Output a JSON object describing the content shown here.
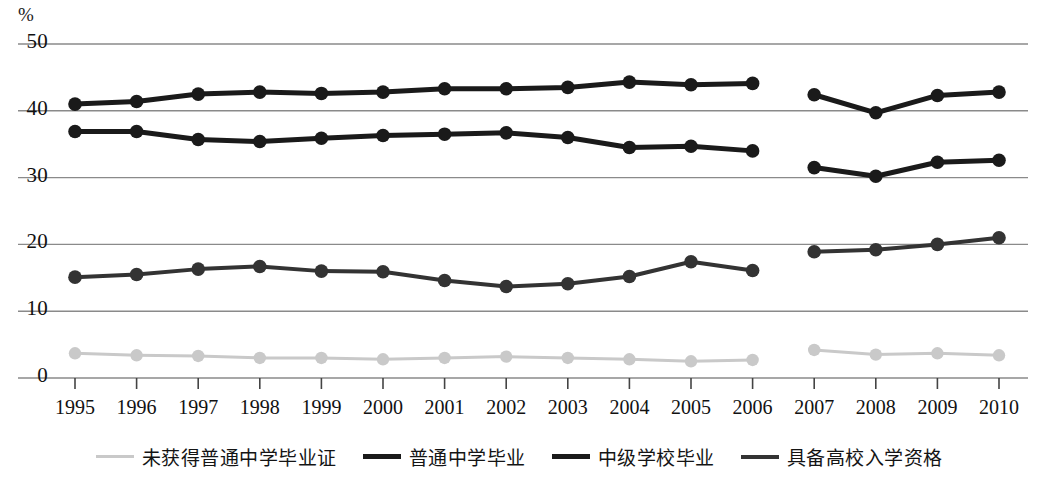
{
  "chart_data": {
    "type": "line",
    "title": "",
    "subtitle": "",
    "xlabel": "",
    "ylabel": "%",
    "unit_label": "%",
    "categories": [
      "1995",
      "1996",
      "1997",
      "1998",
      "1999",
      "2000",
      "2001",
      "2002",
      "2003",
      "2004",
      "2005",
      "2006",
      "2007",
      "2008",
      "2009",
      "2010"
    ],
    "ylim": [
      0,
      50
    ],
    "yticks": [
      0,
      10,
      20,
      30,
      40,
      50
    ],
    "ytick_labels": [
      "0",
      "10",
      "20",
      "30",
      "40",
      "50"
    ],
    "grid": true,
    "grid_axis": "y",
    "legend_position": "bottom",
    "series_break_after": "2006",
    "series": [
      {
        "name": "未获得普通中学毕业证",
        "color": "#c9c9c9",
        "marker": "circle",
        "values": [
          3.7,
          3.4,
          3.3,
          3.0,
          3.0,
          2.8,
          3.0,
          3.2,
          3.0,
          2.8,
          2.5,
          2.7,
          4.2,
          3.5,
          3.7,
          3.4
        ]
      },
      {
        "name": "普通中学毕业",
        "color": "#1a1a1a",
        "marker": "circle",
        "values": [
          41.0,
          41.4,
          42.5,
          42.8,
          42.6,
          42.8,
          43.3,
          43.3,
          43.5,
          44.3,
          43.9,
          44.1,
          42.4,
          39.7,
          42.3,
          42.8
        ]
      },
      {
        "name": "中级学校毕业",
        "color": "#1a1a1a",
        "marker": "circle",
        "values": [
          36.9,
          36.9,
          35.7,
          35.4,
          35.9,
          36.3,
          36.5,
          36.7,
          36.0,
          34.5,
          34.7,
          34.0,
          31.5,
          30.2,
          32.3,
          32.6
        ]
      },
      {
        "name": "具备高校入学资格",
        "color": "#333333",
        "marker": "circle",
        "values": [
          15.1,
          15.5,
          16.3,
          16.7,
          16.0,
          15.9,
          14.6,
          13.7,
          14.1,
          15.2,
          17.4,
          16.1,
          18.9,
          19.2,
          20.0,
          21.0
        ]
      }
    ]
  },
  "axis": {
    "unit": "%",
    "y_labels": [
      "50",
      "40",
      "30",
      "20",
      "10",
      "0"
    ],
    "x_labels": [
      "1995",
      "1996",
      "1997",
      "1998",
      "1999",
      "2000",
      "2001",
      "2002",
      "2003",
      "2004",
      "2005",
      "2006",
      "2007",
      "2008",
      "2009",
      "2010"
    ]
  },
  "legend": {
    "items": [
      {
        "label": "未获得普通中学毕业证",
        "color": "#c9c9c9",
        "width": 3
      },
      {
        "label": "普通中学毕业",
        "color": "#1a1a1a",
        "width": 5
      },
      {
        "label": "中级学校毕业",
        "color": "#1a1a1a",
        "width": 5
      },
      {
        "label": "具备高校入学资格",
        "color": "#333333",
        "width": 4
      }
    ]
  },
  "colors": {
    "gridline": "#8a8a8a",
    "background": "#ffffff",
    "text": "#111111"
  }
}
